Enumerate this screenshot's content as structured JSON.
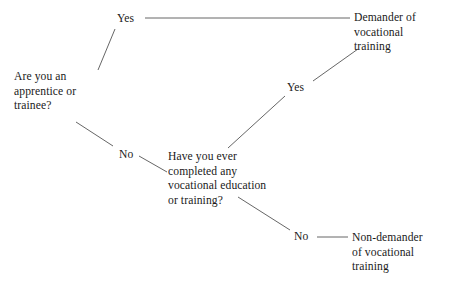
{
  "diagram": {
    "type": "decision-tree",
    "background_color": "#ffffff",
    "text_color": "#1a1a1a",
    "edge_color": "#555555",
    "nodes": {
      "question_1": "Are you an\napprentice or\ntrainee?",
      "question_2": "Have you ever\ncompleted any\nvocational education\nor training?",
      "outcome_demander": "Demander of\nvocational\ntraining",
      "outcome_non_demander": "Non-demander\nof vocational\ntraining"
    },
    "edge_labels": {
      "q1_yes": "Yes",
      "q1_no": "No",
      "q2_yes": "Yes",
      "q2_no": "No"
    },
    "edges": [
      {
        "name": "q1-to-yes1",
        "from": "question_1",
        "to": "q1_yes",
        "x1": 98,
        "y1": 70,
        "x2": 115,
        "y2": 29
      },
      {
        "name": "yes1-to-demander",
        "from": "q1_yes",
        "to": "outcome_demander",
        "x1": 145,
        "y1": 18,
        "x2": 350,
        "y2": 18
      },
      {
        "name": "q1-to-no1",
        "from": "question_1",
        "to": "q1_no",
        "x1": 76,
        "y1": 122,
        "x2": 113,
        "y2": 146
      },
      {
        "name": "no1-to-q2",
        "from": "q1_no",
        "to": "question_2",
        "x1": 139,
        "y1": 156,
        "x2": 167,
        "y2": 172
      },
      {
        "name": "q2-to-yes2",
        "from": "question_2",
        "to": "q2_yes",
        "x1": 228,
        "y1": 148,
        "x2": 285,
        "y2": 96
      },
      {
        "name": "yes2-to-demander",
        "from": "q2_yes",
        "to": "outcome_demander",
        "x1": 313,
        "y1": 81,
        "x2": 358,
        "y2": 49
      },
      {
        "name": "q2-to-no2",
        "from": "question_2",
        "to": "q2_no",
        "x1": 238,
        "y1": 197,
        "x2": 290,
        "y2": 230
      },
      {
        "name": "no2-to-non-demander",
        "from": "q2_no",
        "to": "outcome_non_demander",
        "x1": 317,
        "y1": 237,
        "x2": 348,
        "y2": 237
      }
    ]
  }
}
